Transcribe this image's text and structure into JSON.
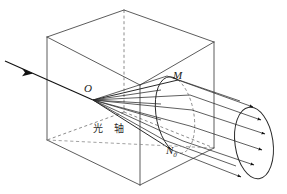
{
  "figure": {
    "background_color": "#ffffff",
    "line_color": "#3a3a3a",
    "ray_color": "#1a1a1a",
    "width": 287,
    "height": 194
  },
  "labels": {
    "point_o": "O",
    "point_m": "M",
    "point_n": "N",
    "point_n_sub": "0",
    "optical_axis": "光 轴"
  },
  "icons": {
    "incoming_ray": "arrow-right-icon",
    "exit_rays": "arrow-right-icon"
  },
  "geometry": {
    "cube": {
      "front_top_left": [
        47,
        37
      ],
      "front_top_right": [
        140,
        85
      ],
      "front_bottom_left": [
        47,
        140
      ],
      "front_bottom_right": [
        140,
        185
      ],
      "back_top_left": [
        124,
        10
      ],
      "back_top_right": [
        214,
        42
      ],
      "back_bottom_right": [
        214,
        148
      ],
      "back_bottom_left": [
        124,
        112
      ]
    },
    "apex_o": [
      93,
      100
    ],
    "cone_ellipse": {
      "center": [
        176,
        113
      ],
      "rx": 16,
      "ry": 40,
      "top_m": [
        178,
        80
      ],
      "bottom_n": [
        172,
        150
      ]
    },
    "screen_ellipse": {
      "center": [
        254,
        143
      ],
      "rx": 19,
      "ry": 36
    },
    "incoming_ray": {
      "start": [
        5,
        61
      ],
      "end": [
        93,
        100
      ],
      "arrow_at": [
        28,
        72
      ]
    }
  }
}
